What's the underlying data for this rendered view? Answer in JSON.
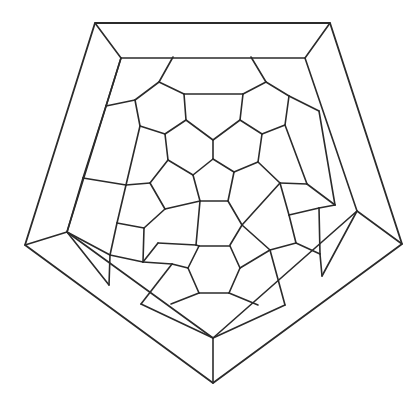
{
  "diagram": {
    "title": "",
    "stroke_color": "#2b2b2b",
    "background_color": "#ffffff",
    "outer_pentagon": [
      [
        95,
        23
      ],
      [
        330,
        23
      ],
      [
        402,
        244
      ],
      [
        213,
        383
      ],
      [
        25,
        245
      ]
    ],
    "inner_pentagon": [
      [
        121,
        58
      ],
      [
        305,
        58
      ],
      [
        357,
        211
      ],
      [
        213,
        338
      ],
      [
        67,
        232
      ]
    ],
    "edges": [
      [
        [
          95,
          23
        ],
        [
          121,
          58
        ]
      ],
      [
        [
          330,
          23
        ],
        [
          305,
          58
        ]
      ],
      [
        [
          402,
          244
        ],
        [
          357,
          211
        ]
      ],
      [
        [
          213,
          383
        ],
        [
          213,
          338
        ]
      ],
      [
        [
          25,
          245
        ],
        [
          67,
          232
        ]
      ],
      [
        [
          121,
          58
        ],
        [
          106,
          106
        ]
      ],
      [
        [
          106,
          106
        ],
        [
          135,
          100
        ]
      ],
      [
        [
          173,
          57
        ],
        [
          159,
          82
        ]
      ],
      [
        [
          159,
          82
        ],
        [
          184,
          94
        ]
      ],
      [
        [
          184,
          94
        ],
        [
          186,
          120
        ]
      ],
      [
        [
          186,
          120
        ],
        [
          165,
          134
        ]
      ],
      [
        [
          165,
          134
        ],
        [
          140,
          126
        ]
      ],
      [
        [
          140,
          126
        ],
        [
          135,
          100
        ]
      ],
      [
        [
          135,
          100
        ],
        [
          159,
          82
        ]
      ],
      [
        [
          184,
          94
        ],
        [
          243,
          94
        ]
      ],
      [
        [
          251,
          57
        ],
        [
          266,
          82
        ]
      ],
      [
        [
          266,
          82
        ],
        [
          289,
          96
        ]
      ],
      [
        [
          289,
          96
        ],
        [
          285,
          125
        ]
      ],
      [
        [
          285,
          125
        ],
        [
          262,
          134
        ]
      ],
      [
        [
          262,
          134
        ],
        [
          240,
          120
        ]
      ],
      [
        [
          240,
          120
        ],
        [
          243,
          94
        ]
      ],
      [
        [
          243,
          94
        ],
        [
          266,
          82
        ]
      ],
      [
        [
          289,
          96
        ],
        [
          319,
          111
        ]
      ],
      [
        [
          186,
          120
        ],
        [
          213,
          140
        ]
      ],
      [
        [
          213,
          140
        ],
        [
          240,
          120
        ]
      ],
      [
        [
          213,
          140
        ],
        [
          213,
          159
        ]
      ],
      [
        [
          213,
          159
        ],
        [
          234,
          172
        ]
      ],
      [
        [
          234,
          172
        ],
        [
          228,
          201
        ]
      ],
      [
        [
          228,
          201
        ],
        [
          200,
          201
        ]
      ],
      [
        [
          200,
          201
        ],
        [
          193,
          175
        ]
      ],
      [
        [
          193,
          175
        ],
        [
          213,
          159
        ]
      ],
      [
        [
          140,
          126
        ],
        [
          126,
          185
        ]
      ],
      [
        [
          165,
          134
        ],
        [
          168,
          160
        ]
      ],
      [
        [
          168,
          160
        ],
        [
          193,
          175
        ]
      ],
      [
        [
          168,
          160
        ],
        [
          150,
          183
        ]
      ],
      [
        [
          150,
          183
        ],
        [
          126,
          185
        ]
      ],
      [
        [
          126,
          185
        ],
        [
          83,
          178
        ]
      ],
      [
        [
          83,
          178
        ],
        [
          106,
          106
        ]
      ],
      [
        [
          262,
          134
        ],
        [
          258,
          162
        ]
      ],
      [
        [
          258,
          162
        ],
        [
          234,
          172
        ]
      ],
      [
        [
          258,
          162
        ],
        [
          280,
          183
        ]
      ],
      [
        [
          285,
          125
        ],
        [
          307,
          184
        ]
      ],
      [
        [
          307,
          184
        ],
        [
          280,
          183
        ]
      ],
      [
        [
          307,
          184
        ],
        [
          335,
          205
        ]
      ],
      [
        [
          335,
          205
        ],
        [
          319,
          111
        ]
      ],
      [
        [
          150,
          183
        ],
        [
          165,
          209
        ]
      ],
      [
        [
          165,
          209
        ],
        [
          200,
          201
        ]
      ],
      [
        [
          165,
          209
        ],
        [
          144,
          228
        ]
      ],
      [
        [
          144,
          228
        ],
        [
          117,
          223
        ]
      ],
      [
        [
          117,
          223
        ],
        [
          126,
          185
        ]
      ],
      [
        [
          83,
          178
        ],
        [
          67,
          232
        ]
      ],
      [
        [
          117,
          223
        ],
        [
          110,
          255
        ]
      ],
      [
        [
          110,
          255
        ],
        [
          67,
          232
        ]
      ],
      [
        [
          110,
          255
        ],
        [
          143,
          262
        ]
      ],
      [
        [
          143,
          262
        ],
        [
          144,
          228
        ]
      ],
      [
        [
          143,
          262
        ],
        [
          158,
          243
        ]
      ],
      [
        [
          228,
          201
        ],
        [
          242,
          225
        ]
      ],
      [
        [
          242,
          225
        ],
        [
          280,
          183
        ]
      ],
      [
        [
          280,
          183
        ],
        [
          289,
          215
        ]
      ],
      [
        [
          289,
          215
        ],
        [
          319,
          208
        ]
      ],
      [
        [
          319,
          208
        ],
        [
          335,
          205
        ]
      ],
      [
        [
          242,
          225
        ],
        [
          230,
          245
        ]
      ],
      [
        [
          289,
          215
        ],
        [
          296,
          243
        ]
      ],
      [
        [
          296,
          243
        ],
        [
          270,
          250
        ]
      ],
      [
        [
          270,
          250
        ],
        [
          242,
          225
        ]
      ],
      [
        [
          319,
          208
        ],
        [
          320,
          254
        ]
      ],
      [
        [
          320,
          254
        ],
        [
          296,
          243
        ]
      ],
      [
        [
          200,
          201
        ],
        [
          196,
          245
        ]
      ],
      [
        [
          158,
          243
        ],
        [
          196,
          245
        ]
      ],
      [
        [
          196,
          245
        ],
        [
          199,
          246
        ]
      ],
      [
        [
          199,
          246
        ],
        [
          230,
          246
        ]
      ],
      [
        [
          199,
          246
        ],
        [
          188,
          268
        ]
      ],
      [
        [
          188,
          268
        ],
        [
          199,
          293
        ]
      ],
      [
        [
          199,
          293
        ],
        [
          229,
          293
        ]
      ],
      [
        [
          229,
          293
        ],
        [
          240,
          268
        ]
      ],
      [
        [
          240,
          268
        ],
        [
          230,
          246
        ]
      ],
      [
        [
          188,
          268
        ],
        [
          172,
          264
        ]
      ],
      [
        [
          143,
          262
        ],
        [
          172,
          264
        ]
      ],
      [
        [
          240,
          268
        ],
        [
          270,
          250
        ]
      ],
      [
        [
          172,
          264
        ],
        [
          141,
          304
        ]
      ],
      [
        [
          199,
          293
        ],
        [
          171,
          304
        ]
      ],
      [
        [
          229,
          293
        ],
        [
          258,
          305
        ]
      ],
      [
        [
          270,
          250
        ],
        [
          285,
          305
        ]
      ],
      [
        [
          141,
          304
        ],
        [
          213,
          338
        ]
      ],
      [
        [
          285,
          305
        ],
        [
          213,
          338
        ]
      ],
      [
        [
          110,
          255
        ],
        [
          109,
          285
        ]
      ],
      [
        [
          320,
          254
        ],
        [
          322,
          276
        ]
      ],
      [
        [
          109,
          285
        ],
        [
          67,
          232
        ]
      ],
      [
        [
          322,
          276
        ],
        [
          357,
          211
        ]
      ]
    ]
  }
}
